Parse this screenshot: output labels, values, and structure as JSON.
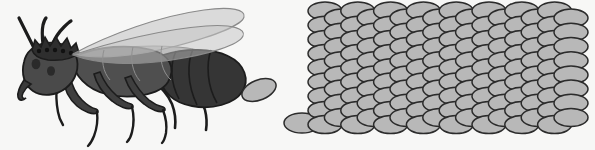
{
  "scene": {
    "title": "Egg-laying winged insect with egg mass",
    "width": 595,
    "height": 150,
    "background_color": "#f7f7f6",
    "style": "grayscale cartoon line illustration"
  },
  "palette": {
    "background": "#f7f7f6",
    "outline": "#1c1c1c",
    "body_dark": "#3a3a3a",
    "head_dark": "#4a4a4a",
    "thorax_mid": "#4f4f4f",
    "abdomen_dark": "#353535",
    "wing_fill": "#b0b0b0",
    "wing_upper_fill": "#c3c3c3",
    "wing_lower_fill": "#a8a8a8",
    "egg_fill": "#b8b8b8",
    "egg_outline": "#2b2b2b",
    "leg_dark": "#3f3f3f",
    "crown_dark": "#2e2e2e"
  },
  "insect": {
    "label": "winged queen insect",
    "facing": "left",
    "parts": [
      {
        "name": "antenna-left",
        "count": 1,
        "label": "Left antenna"
      },
      {
        "name": "antenna-right",
        "count": 1,
        "label": "Right antenna"
      },
      {
        "name": "crown-crest",
        "count": 1,
        "label": "Spiked crown crest",
        "spike_count": 5,
        "bump_count": 5
      },
      {
        "name": "head",
        "count": 1,
        "label": "Head"
      },
      {
        "name": "eye",
        "count": 2,
        "label": "Eye spots"
      },
      {
        "name": "mandible",
        "count": 1,
        "label": "Mandible"
      },
      {
        "name": "thorax",
        "count": 1,
        "label": "Thorax"
      },
      {
        "name": "abdomen",
        "count": 1,
        "label": "Segmented abdomen",
        "segment_count": 4
      },
      {
        "name": "leg",
        "count": 6,
        "label": "Legs (three pairs)"
      },
      {
        "name": "wing-upper",
        "count": 2,
        "label": "Upper translucent wings"
      },
      {
        "name": "wing-lower",
        "count": 1,
        "label": "Lower translucent wing"
      },
      {
        "name": "emerging-egg",
        "count": 1,
        "label": "Egg emerging from abdomen"
      }
    ]
  },
  "egg_cluster": {
    "label": "Egg mass",
    "single_egg_label": "Isolated single egg",
    "single_egg": {
      "cx": 302,
      "cy": 123,
      "rx": 18,
      "ry": 10
    },
    "grid": {
      "columns": 16,
      "rows_raised": 9,
      "rows_lowered": 8,
      "total_eggs": 136,
      "origin_x": 325,
      "origin_y": 11,
      "col_step": 16.4,
      "row_step": 14.2,
      "egg_rx": 17,
      "egg_ry": 9,
      "raised_offset_y": 0,
      "lowered_offset_y": 7.1,
      "phase_note": "odd columns sit higher, even columns drop by half a row"
    }
  }
}
